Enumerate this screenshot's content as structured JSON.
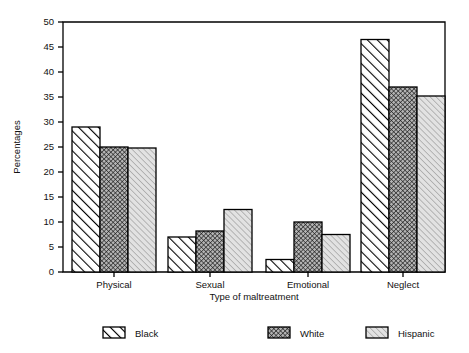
{
  "chart_data": {
    "type": "bar",
    "title": "",
    "xlabel": "Type of maltreatment",
    "ylabel": "Percentages",
    "categories": [
      "Physical",
      "Sexual",
      "Emotional",
      "Neglect"
    ],
    "ylim": [
      0,
      50
    ],
    "yticks": [
      0,
      5,
      10,
      15,
      20,
      25,
      30,
      35,
      40,
      45,
      50
    ],
    "ytick_labels": [
      "0",
      "5",
      "10",
      "15",
      "20",
      "25",
      "30",
      "35",
      "40",
      "45",
      "50"
    ],
    "grid": false,
    "legend_position": "bottom",
    "series": [
      {
        "name": "Black",
        "pattern": "diagonal-hatch",
        "fill": "#ffffff",
        "stroke": "#000000",
        "values": [
          29.0,
          7.0,
          2.5,
          46.5
        ]
      },
      {
        "name": "White",
        "pattern": "cross-hatch-dark",
        "fill": "#a8a8a8",
        "stroke": "#000000",
        "values": [
          25.0,
          8.2,
          10.0,
          37.0
        ]
      },
      {
        "name": "Hispanic",
        "pattern": "diagonal-hatch-light",
        "fill": "#d9d9d9",
        "stroke": "#000000",
        "values": [
          24.8,
          12.5,
          7.5,
          35.2
        ]
      }
    ]
  },
  "axis": {
    "y_label": "Percentages",
    "x_label": "Type of maltreatment"
  },
  "legend": {
    "items": [
      {
        "label": "Black"
      },
      {
        "label": "White"
      },
      {
        "label": "Hispanic"
      }
    ]
  },
  "colors": {
    "frame": "#000000",
    "black_fill": "#ffffff",
    "white_fill": "#a8a8a8",
    "hispanic_fill": "#d9d9d9",
    "text": "#111111",
    "background": "#ffffff"
  }
}
